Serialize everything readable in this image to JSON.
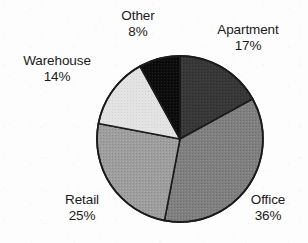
{
  "chart_data": {
    "type": "pie",
    "title": "",
    "subtitle": "",
    "xlabel": "",
    "ylabel": "",
    "legend_position": "none",
    "grid": false,
    "labels_position": "outside",
    "value_unit": "%",
    "total": 100,
    "start_angle_deg": 0,
    "direction": "clockwise",
    "categories": [
      "Apartment",
      "Office",
      "Retail",
      "Warehouse",
      "Other"
    ],
    "values": [
      17,
      36,
      25,
      14,
      8
    ],
    "slices": [
      {
        "name": "Apartment",
        "value": 17,
        "value_text": "17%",
        "color": "#383838",
        "start_angle_deg": 0,
        "end_angle_deg": 61.2
      },
      {
        "name": "Office",
        "value": 36,
        "value_text": "36%",
        "color": "#808080",
        "start_angle_deg": 61.2,
        "end_angle_deg": 190.8
      },
      {
        "name": "Retail",
        "value": 25,
        "value_text": "25%",
        "color": "#9e9e9e",
        "start_angle_deg": 190.8,
        "end_angle_deg": 280.8
      },
      {
        "name": "Warehouse",
        "value": 14,
        "value_text": "14%",
        "color": "#e3e3e3",
        "start_angle_deg": 280.8,
        "end_angle_deg": 331.2
      },
      {
        "name": "Other",
        "value": 8,
        "value_text": "8%",
        "color": "#0d0d0d",
        "start_angle_deg": 331.2,
        "end_angle_deg": 360
      }
    ],
    "geometry": {
      "center_x": 180,
      "center_y": 139,
      "radius": 83
    },
    "colors": {
      "outline": "#1b1b1b",
      "background": "#fdfdfd",
      "text": "#1a1a1a"
    }
  }
}
